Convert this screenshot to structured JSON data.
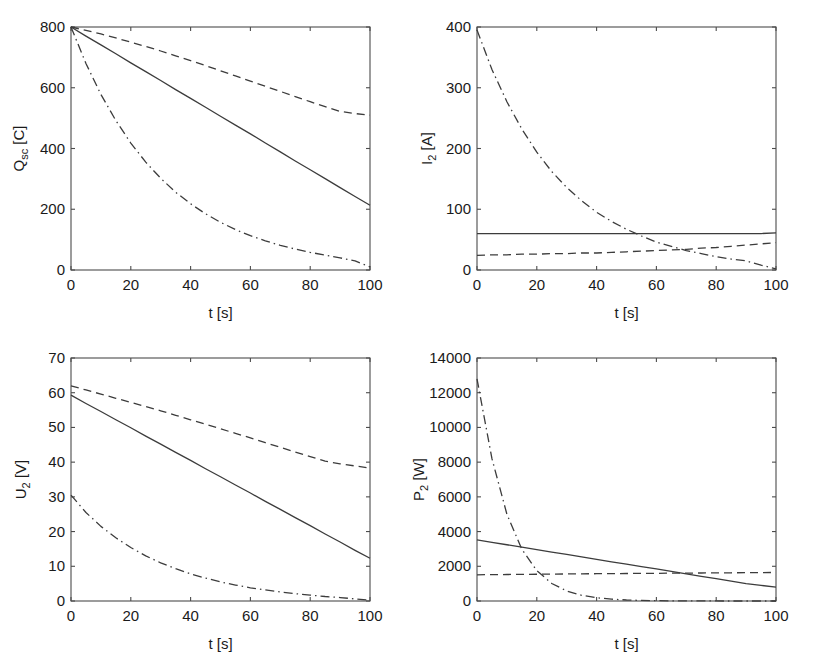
{
  "figure": {
    "background": "#ffffff",
    "line_color": "#3c3c3c",
    "axis_color": "#4c4c4c",
    "layout": "2x2 grid of line plots"
  },
  "chart_data": [
    {
      "id": "q-sc",
      "position": "top-left",
      "type": "line",
      "title": "",
      "xlabel": "t [s]",
      "ylabel": "Q",
      "ylabel_sub": "sc",
      "ylabel_unit": " [C]",
      "ylabel_full": "Q_sc [C]",
      "xlim": [
        0,
        100
      ],
      "ylim": [
        0,
        800
      ],
      "xticks": [
        0,
        20,
        40,
        60,
        80,
        100
      ],
      "yticks": [
        0,
        200,
        400,
        600,
        800
      ],
      "xticklabels": [
        "0",
        "20",
        "40",
        "60",
        "80",
        "100"
      ],
      "yticklabels": [
        "0",
        "200",
        "400",
        "600",
        "800"
      ],
      "grid": false,
      "legend": "none",
      "x": [
        0,
        5,
        10,
        15,
        20,
        25,
        30,
        35,
        40,
        45,
        50,
        55,
        60,
        65,
        70,
        75,
        80,
        85,
        90,
        95,
        100
      ],
      "series": [
        {
          "name": "solid",
          "style": "solid",
          "values": [
            800,
            770,
            741,
            712,
            682,
            653,
            624,
            594,
            565,
            536,
            506,
            477,
            448,
            418,
            389,
            359,
            330,
            301,
            271,
            242,
            213
          ]
        },
        {
          "name": "dashed",
          "style": "dashed",
          "values": [
            800,
            789,
            777,
            764,
            750,
            736,
            721,
            705,
            689,
            673,
            656,
            639,
            622,
            605,
            588,
            571,
            554,
            538,
            522,
            515,
            510
          ]
        },
        {
          "name": "dash-dot",
          "style": "dashdot",
          "values": [
            800,
            680,
            578,
            492,
            418,
            355,
            302,
            256,
            218,
            185,
            157,
            133,
            113,
            96,
            81,
            69,
            58,
            49,
            40,
            30,
            10
          ]
        }
      ]
    },
    {
      "id": "i-2",
      "position": "top-right",
      "type": "line",
      "title": "",
      "xlabel": "t [s]",
      "ylabel": "I",
      "ylabel_sub": "2",
      "ylabel_unit": " [A]",
      "ylabel_full": "I_2 [A]",
      "xlim": [
        0,
        100
      ],
      "ylim": [
        0,
        400
      ],
      "xticks": [
        0,
        20,
        40,
        60,
        80,
        100
      ],
      "yticks": [
        0,
        100,
        200,
        300,
        400
      ],
      "xticklabels": [
        "0",
        "20",
        "40",
        "60",
        "80",
        "100"
      ],
      "yticklabels": [
        "0",
        "100",
        "200",
        "300",
        "400"
      ],
      "grid": false,
      "legend": "none",
      "x": [
        0,
        5,
        10,
        15,
        20,
        25,
        30,
        35,
        40,
        45,
        50,
        55,
        60,
        65,
        70,
        75,
        80,
        85,
        90,
        95,
        100
      ],
      "series": [
        {
          "name": "solid",
          "style": "solid",
          "values": [
            60,
            60,
            60,
            60,
            60,
            60,
            60,
            60,
            60,
            60,
            60,
            60,
            60,
            60,
            60,
            60,
            60,
            60,
            60,
            60,
            61
          ]
        },
        {
          "name": "dashed",
          "style": "dashed",
          "values": [
            24,
            25,
            25,
            26,
            26,
            27,
            27,
            28,
            28,
            29,
            30,
            31,
            32,
            33,
            34,
            36,
            37,
            39,
            41,
            43,
            45
          ]
        },
        {
          "name": "dash-dot",
          "style": "dashdot",
          "values": [
            395,
            330,
            277,
            232,
            194,
            162,
            136,
            114,
            95,
            80,
            67,
            56,
            46,
            39,
            32,
            27,
            22,
            18,
            15,
            8,
            2
          ]
        }
      ]
    },
    {
      "id": "u-2",
      "position": "bottom-left",
      "type": "line",
      "title": "",
      "xlabel": "t [s]",
      "ylabel": "U",
      "ylabel_sub": "2",
      "ylabel_unit": " [V]",
      "ylabel_full": "U_2 [V]",
      "xlim": [
        0,
        100
      ],
      "ylim": [
        0,
        70
      ],
      "xticks": [
        0,
        20,
        40,
        60,
        80,
        100
      ],
      "yticks": [
        0,
        10,
        20,
        30,
        40,
        50,
        60,
        70
      ],
      "xticklabels": [
        "0",
        "20",
        "40",
        "60",
        "80",
        "100"
      ],
      "yticklabels": [
        "0",
        "10",
        "20",
        "30",
        "40",
        "50",
        "60",
        "70"
      ],
      "grid": false,
      "legend": "none",
      "x": [
        0,
        5,
        10,
        15,
        20,
        25,
        30,
        35,
        40,
        45,
        50,
        55,
        60,
        65,
        70,
        75,
        80,
        85,
        90,
        95,
        100
      ],
      "series": [
        {
          "name": "solid",
          "style": "solid",
          "values": [
            59.3,
            56.9,
            54.6,
            52.2,
            49.9,
            47.5,
            45.2,
            42.8,
            40.5,
            38.1,
            35.8,
            33.4,
            31.1,
            28.7,
            26.4,
            24.0,
            21.7,
            19.3,
            17.0,
            14.6,
            12.3
          ]
        },
        {
          "name": "dashed",
          "style": "dashed",
          "values": [
            62.0,
            60.8,
            59.6,
            58.4,
            57.2,
            56.0,
            54.8,
            53.5,
            52.2,
            50.9,
            49.6,
            48.3,
            47.0,
            45.6,
            44.3,
            42.9,
            41.6,
            40.3,
            39.5,
            38.9,
            38.3
          ]
        },
        {
          "name": "dash-dot",
          "style": "dashdot",
          "values": [
            30.5,
            25.5,
            21.5,
            18.2,
            15.4,
            13.0,
            11.0,
            9.3,
            7.8,
            6.6,
            5.5,
            4.6,
            3.8,
            3.2,
            2.6,
            2.1,
            1.7,
            1.3,
            1.0,
            0.6,
            0.2
          ]
        }
      ]
    },
    {
      "id": "p-2",
      "position": "bottom-right",
      "type": "line",
      "title": "",
      "xlabel": "t [s]",
      "ylabel": "P",
      "ylabel_sub": "2",
      "ylabel_unit": " [W]",
      "ylabel_full": "P_2 [W]",
      "xlim": [
        0,
        100
      ],
      "ylim": [
        0,
        14000
      ],
      "xticks": [
        0,
        20,
        40,
        60,
        80,
        100
      ],
      "yticks": [
        0,
        2000,
        4000,
        6000,
        8000,
        10000,
        12000,
        14000
      ],
      "xticklabels": [
        "0",
        "20",
        "40",
        "60",
        "80",
        "100"
      ],
      "yticklabels": [
        "0",
        "2000",
        "4000",
        "6000",
        "8000",
        "10000",
        "12000",
        "14000"
      ],
      "grid": false,
      "legend": "none",
      "x": [
        0,
        5,
        10,
        15,
        20,
        25,
        30,
        35,
        40,
        45,
        50,
        55,
        60,
        65,
        70,
        75,
        80,
        85,
        90,
        95,
        100
      ],
      "series": [
        {
          "name": "solid",
          "style": "solid",
          "values": [
            3520,
            3380,
            3240,
            3100,
            2960,
            2820,
            2680,
            2540,
            2400,
            2260,
            2120,
            1985,
            1845,
            1705,
            1565,
            1425,
            1285,
            1145,
            1005,
            900,
            800
          ]
        },
        {
          "name": "dashed",
          "style": "dashed",
          "values": [
            1510,
            1518,
            1526,
            1534,
            1542,
            1550,
            1558,
            1566,
            1572,
            1578,
            1584,
            1590,
            1596,
            1602,
            1608,
            1614,
            1620,
            1626,
            1632,
            1638,
            1645
          ]
        },
        {
          "name": "dash-dot",
          "style": "dashdot",
          "values": [
            12800,
            8200,
            5000,
            2980,
            1750,
            1010,
            580,
            330,
            185,
            105,
            58,
            32,
            18,
            10,
            6,
            3,
            2,
            1,
            1,
            0,
            0
          ]
        }
      ]
    }
  ]
}
